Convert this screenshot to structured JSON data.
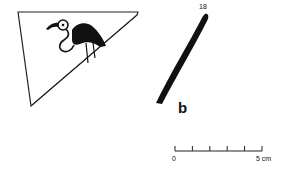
{
  "figure": {
    "profile_number": "18",
    "profile_letter": "b",
    "scale": {
      "start_label": "0",
      "end_label": "5 cm",
      "divisions": 5
    },
    "colors": {
      "ink": "#111111",
      "background": "#ffffff"
    },
    "items": [
      {
        "name": "pottery-shard-with-bird-motif",
        "motif": "long-necked wading bird (black body)"
      },
      {
        "name": "vessel-wall-profile",
        "label": "b"
      }
    ]
  }
}
